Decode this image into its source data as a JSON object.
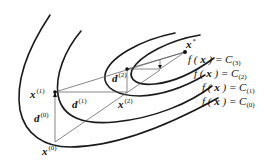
{
  "diagram": {
    "colors": {
      "curve": "#1a1a1a",
      "path": "#555555",
      "text": "#111111"
    },
    "points": {
      "x0": {
        "base": "x",
        "sup": "(0)"
      },
      "x1": {
        "base": "x",
        "sup": "(1)"
      },
      "x2": {
        "base": "x",
        "sup": "(2)"
      },
      "xstar": {
        "base": "x",
        "sup": "*"
      }
    },
    "directions": {
      "d0": {
        "base": "d",
        "sup": "(0)"
      },
      "d1": {
        "base": "d",
        "sup": "(1)"
      },
      "d2": {
        "base": "d",
        "sup": "(2)"
      }
    },
    "level_curves": [
      {
        "prefix": "f ( ",
        "var": "x",
        "mid": " ) = C",
        "sub": "(3)"
      },
      {
        "prefix": "f ( ",
        "var": "x",
        "mid": " ) = C",
        "sub": "(2)"
      },
      {
        "prefix": "f ( ",
        "var": "x",
        "mid": " ) = C",
        "sub": "(1)"
      },
      {
        "prefix": "f ( ",
        "var": "x",
        "mid": " ) = C",
        "sub": "(0)"
      }
    ]
  }
}
